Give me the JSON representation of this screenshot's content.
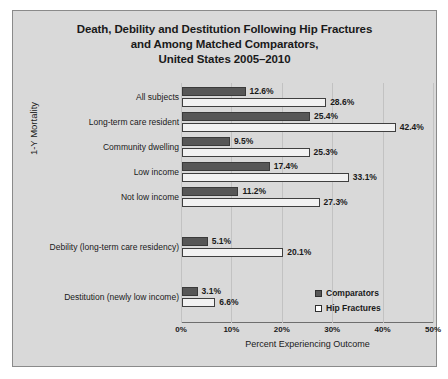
{
  "chart_data": {
    "type": "bar",
    "orientation": "horizontal",
    "title": "Death, Debility and Destitution Following Hip Fractures and Among Matched Comparators, United States 2005–2010",
    "title_lines": [
      "Death, Debility and Destitution Following Hip Fractures",
      "and Among Matched Comparators,",
      "United States 2005–2010"
    ],
    "xlabel": "Percent Experiencing Outcome",
    "ylabel": "1-Y Mortality",
    "xlim": [
      0,
      50
    ],
    "xticks": [
      "0%",
      "10%",
      "20%",
      "30%",
      "40%",
      "50%"
    ],
    "xtick_values": [
      0,
      10,
      20,
      30,
      40,
      50
    ],
    "grid": true,
    "legend_position": "bottom-right",
    "categories": [
      "All subjects",
      "Long-term care resident",
      "Community dwelling",
      "Low income",
      "Not low income",
      "Debility (long-term care residency)",
      "Destitution (newly low income)"
    ],
    "series": [
      {
        "name": "Comparators",
        "color": "#575757",
        "values": [
          12.6,
          25.4,
          9.5,
          17.4,
          11.2,
          5.1,
          3.1
        ],
        "labels": [
          "12.6%",
          "25.4%",
          "9.5%",
          "17.4%",
          "11.2%",
          "5.1%",
          "3.1%"
        ]
      },
      {
        "name": "Hip Fractures",
        "color": "#f2f2f2",
        "values": [
          28.6,
          42.4,
          25.3,
          33.1,
          27.3,
          20.1,
          6.6
        ],
        "labels": [
          "28.6%",
          "42.4%",
          "25.3%",
          "33.1%",
          "27.3%",
          "20.1%",
          "6.6%"
        ]
      }
    ],
    "group_label": "1-Y Mortality",
    "group_label_categories": [
      "All subjects",
      "Long-term care resident",
      "Community dwelling",
      "Low income",
      "Not low income"
    ]
  },
  "legend": {
    "items": [
      {
        "label": "Comparators",
        "swatch": "filled-dark"
      },
      {
        "label": "Hip Fractures",
        "swatch": "outlined-white"
      }
    ]
  },
  "colors": {
    "figure_background": "#d9d9d9",
    "comparators_bar": "#575757",
    "hip_fractures_bar": "#f2f2f2",
    "gridline": "#c2c2c2",
    "axis": "#6e6e6e",
    "text": "#1a1a1a"
  }
}
